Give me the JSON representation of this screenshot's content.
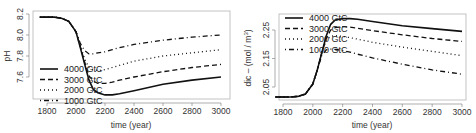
{
  "chart_data": [
    {
      "type": "line",
      "title": "",
      "xlabel": "time (year)",
      "ylabel": "pH",
      "xlim": [
        1750,
        3000
      ],
      "ylim": [
        7.4,
        8.22
      ],
      "xticks": [
        1800,
        2000,
        2200,
        2400,
        2600,
        2800,
        3000
      ],
      "yticks": [
        7.6,
        7.8,
        8.0,
        8.2
      ],
      "ytick_labels": [
        "7.6",
        "7.8",
        "8.0",
        "8.2"
      ],
      "grid": false,
      "legend_position": "bottom-left",
      "x": [
        1750,
        1850,
        1900,
        1950,
        2000,
        2030,
        2060,
        2090,
        2120,
        2150,
        2200,
        2250,
        2300,
        2400,
        2600,
        2800,
        3000
      ],
      "series": [
        {
          "name": "4000 GtC",
          "style": "solid",
          "values": [
            8.17,
            8.17,
            8.16,
            8.13,
            8.03,
            7.88,
            7.72,
            7.57,
            7.48,
            7.45,
            7.43,
            7.43,
            7.44,
            7.47,
            7.53,
            7.57,
            7.6
          ]
        },
        {
          "name": "3000 GtC",
          "style": "dashed",
          "values": [
            8.17,
            8.17,
            8.16,
            8.13,
            8.03,
            7.89,
            7.74,
            7.61,
            7.56,
            7.54,
            7.54,
            7.55,
            7.57,
            7.6,
            7.65,
            7.69,
            7.72
          ]
        },
        {
          "name": "2000 GtC",
          "style": "dotted",
          "values": [
            8.17,
            8.17,
            8.16,
            8.13,
            8.03,
            7.9,
            7.77,
            7.69,
            7.67,
            7.66,
            7.67,
            7.69,
            7.71,
            7.75,
            7.8,
            7.83,
            7.86
          ]
        },
        {
          "name": "1000 GtC",
          "style": "dotdash",
          "values": [
            8.17,
            8.17,
            8.16,
            8.13,
            8.03,
            7.92,
            7.85,
            7.82,
            7.82,
            7.83,
            7.84,
            7.86,
            7.88,
            7.91,
            7.95,
            7.98,
            8.0
          ]
        }
      ]
    },
    {
      "type": "line",
      "title": "",
      "xlabel": "time (year)",
      "ylabel": "dic – (mol / m³)",
      "xlim": [
        1750,
        3000
      ],
      "ylim": [
        2.0,
        2.3
      ],
      "xticks": [
        1800,
        2000,
        2200,
        2400,
        2600,
        2800,
        3000
      ],
      "yticks": [
        2.05,
        2.15,
        2.25
      ],
      "ytick_labels": [
        "2.05",
        "2.15",
        "2.25"
      ],
      "grid": false,
      "legend_position": "top-left",
      "x": [
        1750,
        1850,
        1900,
        1950,
        2000,
        2030,
        2060,
        2090,
        2120,
        2150,
        2200,
        2250,
        2300,
        2400,
        2600,
        2800,
        3000
      ],
      "series": [
        {
          "name": "4000 GtC",
          "style": "solid",
          "values": [
            2.015,
            2.015,
            2.017,
            2.025,
            2.06,
            2.11,
            2.17,
            2.23,
            2.27,
            2.285,
            2.29,
            2.29,
            2.288,
            2.28,
            2.265,
            2.255,
            2.245
          ]
        },
        {
          "name": "3000 GtC",
          "style": "dashed",
          "values": [
            2.015,
            2.015,
            2.017,
            2.025,
            2.06,
            2.11,
            2.17,
            2.22,
            2.25,
            2.258,
            2.262,
            2.26,
            2.256,
            2.248,
            2.233,
            2.22,
            2.21
          ]
        },
        {
          "name": "2000 GtC",
          "style": "dotted",
          "values": [
            2.015,
            2.015,
            2.017,
            2.025,
            2.06,
            2.11,
            2.17,
            2.215,
            2.228,
            2.23,
            2.228,
            2.223,
            2.218,
            2.207,
            2.19,
            2.175,
            2.16
          ]
        },
        {
          "name": "1000 GtC",
          "style": "dotdash",
          "values": [
            2.015,
            2.015,
            2.017,
            2.025,
            2.06,
            2.11,
            2.16,
            2.18,
            2.183,
            2.182,
            2.178,
            2.172,
            2.165,
            2.152,
            2.13,
            2.11,
            2.095
          ]
        }
      ]
    }
  ],
  "legend": {
    "entries": [
      "4000 GtC",
      "3000 GtC",
      "2000 GtC",
      "1000 GtC"
    ]
  },
  "labels": {
    "left_xlabel": "time (year)",
    "left_ylabel": "pH",
    "right_xlabel": "time (year)",
    "right_ylabel_main": "dic – (mol / m",
    "right_ylabel_sup": "3",
    "right_ylabel_close": ")"
  }
}
